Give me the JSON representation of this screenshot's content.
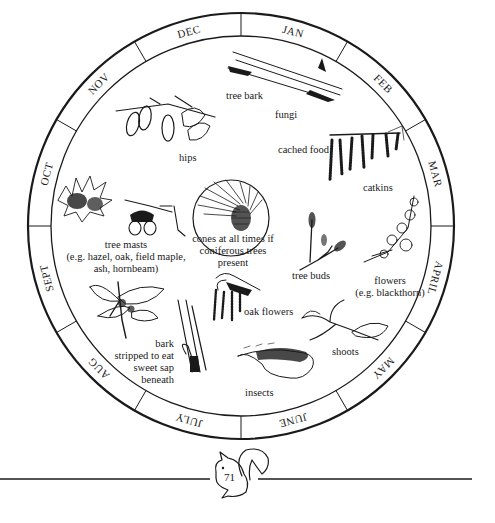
{
  "diagram": {
    "type": "annual-wheel",
    "center": [
      241,
      226
    ],
    "outer_radius": 213,
    "inner_radius": 190,
    "months": [
      {
        "label": "JAN",
        "angle": -75
      },
      {
        "label": "FEB",
        "angle": -45
      },
      {
        "label": "MAR",
        "angle": -15
      },
      {
        "label": "APRIL",
        "angle": 15
      },
      {
        "label": "MAY",
        "angle": 45
      },
      {
        "label": "JUNE",
        "angle": 75
      },
      {
        "label": "JULY",
        "angle": 105
      },
      {
        "label": "AUG",
        "angle": 135
      },
      {
        "label": "SEPT",
        "angle": 165
      },
      {
        "label": "OCT",
        "angle": 195
      },
      {
        "label": "NOV",
        "angle": 225
      },
      {
        "label": "DEC",
        "angle": 255
      }
    ],
    "food_items": {
      "tree_bark": "tree bark",
      "fungi": "fungi",
      "cached_food": "cached food",
      "hips": "hips",
      "catkins": "catkins",
      "tree_masts_1": "tree masts",
      "tree_masts_2": "(e.g. hazel, oak, field maple,",
      "tree_masts_3": "ash, hornbeam)",
      "cones_1": "cones at all times if",
      "cones_2": "coniferous trees",
      "cones_3": "present",
      "tree_buds": "tree buds",
      "flowers_1": "flowers",
      "flowers_2": "(e.g. blackthorn)",
      "oak_flowers": "oak flowers",
      "bark_1": "bark",
      "bark_2": "stripped to eat",
      "bark_3": "sweet sap",
      "bark_4": "beneath",
      "shoots": "shoots",
      "insects": "insects"
    },
    "illustrations": [
      "tree-bark-twig",
      "rose-hips-branch",
      "alder-catkins",
      "hazelnut-husk",
      "acorns-twig",
      "pine-cone-needles",
      "sycamore-seeds",
      "tree-buds-twig",
      "blackthorn-flowers",
      "oak-flower-tassels",
      "stripped-bark-branch",
      "leafy-shoots",
      "caterpillar-insect"
    ]
  },
  "footer": {
    "page_number": "71",
    "mascot": "squirrel"
  }
}
